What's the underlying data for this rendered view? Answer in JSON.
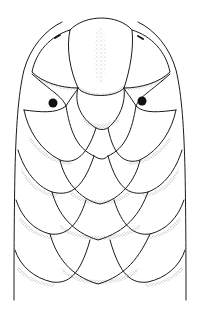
{
  "caption": {
    "text": "(cut-off caption text at top edge)"
  },
  "figure": {
    "style": "pen-and-ink line drawing with stippling",
    "ink_color": "#1a1a1a",
    "background_color": "#ffffff",
    "features": [
      "rostral-scale",
      "nostrils",
      "eyes",
      "imbricate-dorsal-scales",
      "body-outline"
    ]
  }
}
